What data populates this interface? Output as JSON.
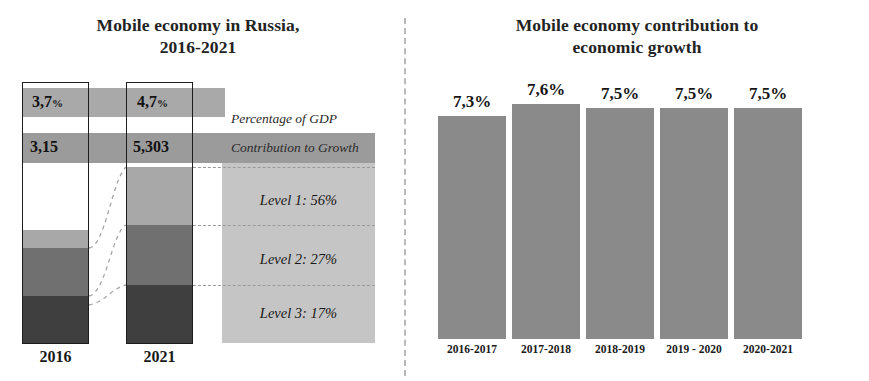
{
  "left_chart": {
    "title": "Mobile economy in Russia,\n2016-2021",
    "title_line1": "Mobile economy in Russia,",
    "title_line2": "2016-2021",
    "columns": [
      {
        "label": "2016",
        "gdp_value": "3,7",
        "gdp_unit": "%",
        "growth_value": "3,15"
      },
      {
        "label": "2021",
        "gdp_value": "4,7",
        "gdp_unit": "%",
        "growth_value": "5,303"
      }
    ],
    "captions": {
      "gdp": "Percentage of GDP",
      "growth": "Contribution to Growth"
    },
    "levels": [
      {
        "name": "Level 1",
        "value": "56%",
        "text": "Level 1: 56%"
      },
      {
        "name": "Level 2",
        "value": "27%",
        "text": "Level 2: 27%"
      },
      {
        "name": "Level 3",
        "value": "17%",
        "text": "Level 3: 17%"
      }
    ],
    "colors": {
      "level1": "#a8a8a8",
      "level2": "#707070",
      "level3": "#3f3f3f",
      "band_gdp": "#a9a9a9",
      "band_growth": "#9b9b9b",
      "legend_panel": "#c5c5c5",
      "outline": "#1d1d1d"
    }
  },
  "right_chart": {
    "title_line1": "Mobile economy contribution to",
    "title_line2": "economic growth",
    "bar_color": "#8a8a8a"
  },
  "chart_data": [
    {
      "type": "bar",
      "id": "mobile-economy-russia-stacked",
      "title": "Mobile economy in Russia, 2016-2021",
      "xlabel": "",
      "ylabel": "",
      "stacked": true,
      "categories": [
        "2016",
        "2021"
      ],
      "series": [
        {
          "name": "Level 1: 56%",
          "values": [
            56,
            56
          ]
        },
        {
          "name": "Level 2: 27%",
          "values": [
            27,
            27
          ]
        },
        {
          "name": "Level 3: 17%",
          "values": [
            17,
            17
          ]
        }
      ],
      "annotations": [
        {
          "label": "Percentage of GDP",
          "values": [
            "3,7 %",
            "4,7 %"
          ]
        },
        {
          "label": "Contribution to Growth",
          "values": [
            "3,15",
            "5,303"
          ]
        }
      ],
      "grid": false,
      "legend_position": "right"
    },
    {
      "type": "bar",
      "id": "mobile-economy-contribution",
      "title": "Mobile economy contribution to economic growth",
      "xlabel": "",
      "ylabel": "",
      "categories": [
        "2016-2017",
        "2017-2018",
        "2018-2019",
        "2019 - 2020",
        "2020-2021"
      ],
      "values": [
        7.3,
        7.6,
        7.5,
        7.5,
        7.5
      ],
      "value_labels": [
        "7,3%",
        "7,6%",
        "7,5%",
        "7,5%",
        "7,5%"
      ],
      "ylim": [
        0,
        8
      ],
      "grid": false,
      "legend_position": "none"
    }
  ]
}
